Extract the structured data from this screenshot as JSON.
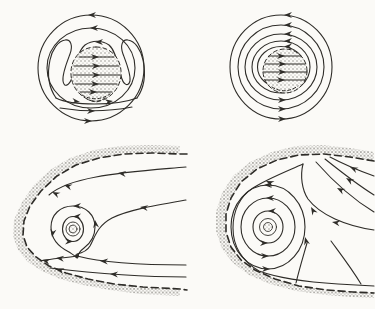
{
  "canvas": {
    "width": 375,
    "height": 309,
    "background_color": "#fbfaf7",
    "ink_color": "#2e2c28",
    "stipple_color": "#8f8d88"
  },
  "figure": {
    "kind": "streamline-flow-diagram",
    "panel_count": 4,
    "rows": 2,
    "columns": 2,
    "has_text_labels": false
  },
  "panels": [
    {
      "id": "top-left",
      "name": "circulating-drop-with-recirculation-lobes",
      "outer_streamline_rings": 2,
      "internal_streamlines": 5,
      "recirculation_lobes": 2,
      "drop_outline_style": "dashed",
      "drop_fill": "stippled",
      "outer_rotation": "counterclockwise",
      "internal_arrow_direction": "right",
      "top_arrow_direction": "left",
      "bottom_arrow_direction": "right"
    },
    {
      "id": "top-right",
      "name": "circulating-drop-concentric-streamlines",
      "outer_streamline_rings": 5,
      "internal_streamlines": 4,
      "drop_outline_style": "dashed",
      "drop_fill": "stippled",
      "outer_rotation": "counterclockwise",
      "internal_arrow_direction": "right",
      "top_arrow_direction": "left",
      "bottom_arrow_direction": "right"
    },
    {
      "id": "bottom-left",
      "name": "finger-tip-cavity-with-small-vortex",
      "wall_style": "stippled-band-with-dashed-inner-edge",
      "closed_loops": 2,
      "has_vortex_core": true,
      "has_stagnation_point": true,
      "vortex_rotation": "counterclockwise",
      "near_wall_arrow_direction": "left"
    },
    {
      "id": "bottom-right",
      "name": "finger-tip-cavity-with-large-vortex",
      "wall_style": "stippled-band-with-dashed-inner-edge",
      "closed_loops": 3,
      "has_vortex_core": true,
      "has_stagnation_point": false,
      "vortex_rotation": "counterclockwise",
      "incoming_arrow_direction": "up-left"
    }
  ]
}
